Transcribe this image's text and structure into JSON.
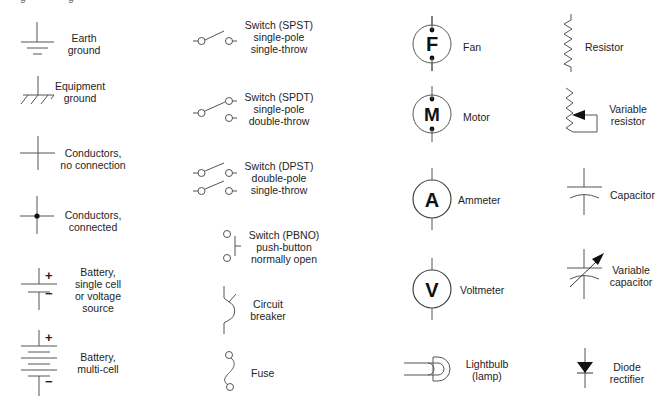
{
  "top_cutoff_fragments": [
    "g",
    "g"
  ],
  "columns": [
    {
      "id": "col1",
      "items": [
        {
          "key": "earth_ground",
          "label": "Earth\nground"
        },
        {
          "key": "equipment_ground",
          "label": "Equipment\nground"
        },
        {
          "key": "conductors_no_connection",
          "label": "Conductors,\nno connection"
        },
        {
          "key": "conductors_connected",
          "label": "Conductors,\nconnected"
        },
        {
          "key": "battery_single",
          "label": "Battery,\nsingle cell\nor voltage\nsource",
          "plus": "+",
          "minus": "−"
        },
        {
          "key": "battery_multi",
          "label": "Battery,\nmulti-cell",
          "plus": "+",
          "minus": "−"
        }
      ]
    },
    {
      "id": "col2",
      "items": [
        {
          "key": "switch_spst",
          "label": "Switch (SPST)\nsingle-pole\nsingle-throw"
        },
        {
          "key": "switch_spdt",
          "label": "Switch (SPDT)\nsingle-pole\ndouble-throw"
        },
        {
          "key": "switch_dpst",
          "label": "Switch (DPST)\ndouble-pole\nsingle-throw"
        },
        {
          "key": "switch_pbno",
          "label": "Switch (PBNO)\npush-button\nnormally open"
        },
        {
          "key": "circuit_breaker",
          "label": "Circuit\nbreaker"
        },
        {
          "key": "fuse",
          "label": "Fuse"
        }
      ]
    },
    {
      "id": "col3",
      "items": [
        {
          "key": "fan",
          "label": "Fan",
          "glyph": "F"
        },
        {
          "key": "motor",
          "label": "Motor",
          "glyph": "M"
        },
        {
          "key": "ammeter",
          "label": "Ammeter",
          "glyph": "A"
        },
        {
          "key": "voltmeter",
          "label": "Voltmeter",
          "glyph": "V"
        },
        {
          "key": "lightbulb",
          "label": "Lightbulb\n(lamp)"
        }
      ]
    },
    {
      "id": "col4",
      "items": [
        {
          "key": "resistor",
          "label": "Resistor"
        },
        {
          "key": "variable_resistor",
          "label": "Variable\nresistor"
        },
        {
          "key": "capacitor",
          "label": "Capacitor"
        },
        {
          "key": "variable_capacitor",
          "label": "Variable\ncapacitor"
        },
        {
          "key": "diode",
          "label": "Diode\nrectifier"
        }
      ]
    }
  ],
  "colors": {
    "line": "#555555",
    "fill": "#111111",
    "text": "#1e1e1e",
    "background": "#ffffff"
  }
}
